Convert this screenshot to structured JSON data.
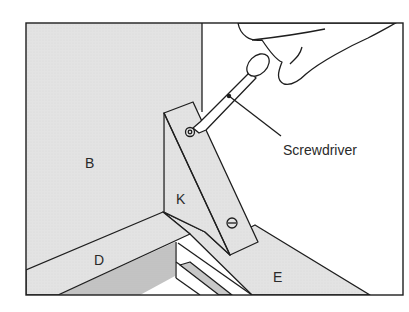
{
  "figure": {
    "type": "assembly-illustration",
    "labels": {
      "panel_back": "B",
      "bracket": "K",
      "rail_front": "D",
      "rail_side": "E",
      "tool": "Screwdriver"
    },
    "colors": {
      "panel": "#e3e3e3",
      "shadow": "#c4c4c4",
      "stroke": "#1e1e1e",
      "background": "#ffffff"
    }
  }
}
